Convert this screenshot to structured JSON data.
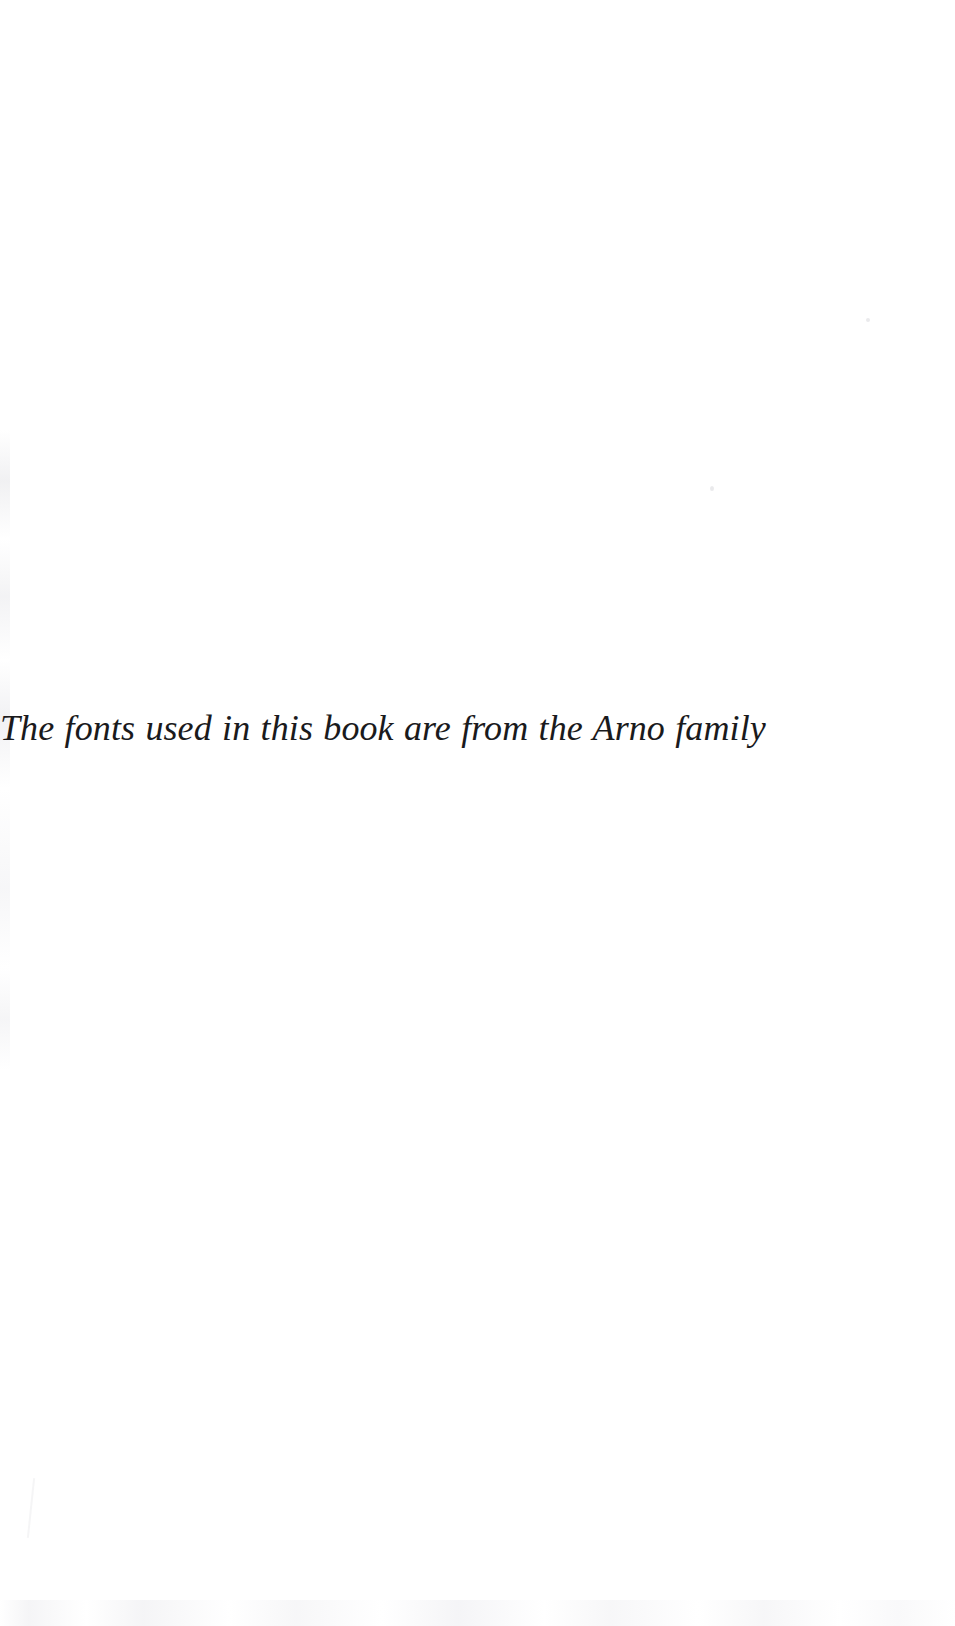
{
  "page": {
    "kind": "colophon",
    "background_color": "#ffffff",
    "ink_color": "#1a1a1c",
    "width_px": 955,
    "height_px": 1626
  },
  "colophon": {
    "line": "The fonts used in this book are from the Arno family",
    "style": "italic-serif",
    "alignment": "centered"
  },
  "artifacts": {
    "speck_upper_right": "scan-speck",
    "speck_mid_right": "scan-speck",
    "left_edge": "scan-edge-streak",
    "bottom_edge": "scan-edge-smudge",
    "bottom_hairline": "scan-hairline"
  }
}
